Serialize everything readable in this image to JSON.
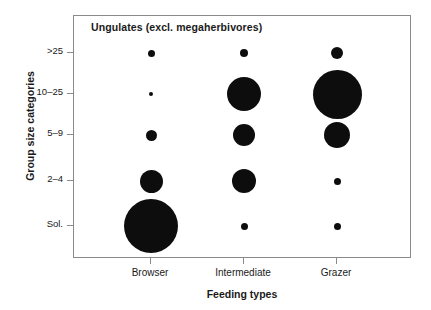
{
  "chart_data": {
    "type": "scatter",
    "title": "Ungulates (excl. megaherbivores)",
    "xlabel": "Feeding types",
    "ylabel": "Group size categories",
    "categories": [
      "Browser",
      "Intermediate",
      "Grazer"
    ],
    "y_categories": [
      "Sol.",
      "2–4",
      "5–9",
      "10–25",
      ">25"
    ],
    "grid": false,
    "legend": null,
    "bubble_color": "#0d0d0d",
    "points": [
      {
        "x": "Browser",
        "y": ">25",
        "size": 7
      },
      {
        "x": "Browser",
        "y": "10–25",
        "size": 4
      },
      {
        "x": "Browser",
        "y": "5–9",
        "size": 11
      },
      {
        "x": "Browser",
        "y": "2–4",
        "size": 23
      },
      {
        "x": "Browser",
        "y": "Sol.",
        "size": 54
      },
      {
        "x": "Intermediate",
        "y": ">25",
        "size": 8
      },
      {
        "x": "Intermediate",
        "y": "10–25",
        "size": 34
      },
      {
        "x": "Intermediate",
        "y": "5–9",
        "size": 22
      },
      {
        "x": "Intermediate",
        "y": "2–4",
        "size": 24
      },
      {
        "x": "Intermediate",
        "y": "Sol.",
        "size": 7
      },
      {
        "x": "Grazer",
        "y": ">25",
        "size": 12
      },
      {
        "x": "Grazer",
        "y": "10–25",
        "size": 49
      },
      {
        "x": "Grazer",
        "y": "5–9",
        "size": 26
      },
      {
        "x": "Grazer",
        "y": "2–4",
        "size": 7
      },
      {
        "x": "Grazer",
        "y": "Sol.",
        "size": 7
      }
    ]
  },
  "chart": {
    "title": "Ungulates (excl. megaherbivores)",
    "x_axis": {
      "label": "Feeding types",
      "ticks": [
        {
          "label": "Browser",
          "px": 150
        },
        {
          "label": "Intermediate",
          "px": 243
        },
        {
          "label": "Grazer",
          "px": 336
        }
      ]
    },
    "y_axis": {
      "label": "Group size categories",
      "ticks": [
        {
          "label": ">25",
          "px": 52
        },
        {
          "label": "10–25",
          "px": 93
        },
        {
          "label": "5–9",
          "px": 134
        },
        {
          "label": "2–4",
          "px": 180
        },
        {
          "label": "Sol.",
          "px": 225
        }
      ]
    },
    "bubbles": [
      {
        "name": "browser-gt25",
        "cx": 150,
        "cy": 52,
        "d": 7
      },
      {
        "name": "browser-10-25",
        "cx": 150,
        "cy": 93,
        "d": 4
      },
      {
        "name": "browser-5-9",
        "cx": 150,
        "cy": 134,
        "d": 11
      },
      {
        "name": "browser-2-4",
        "cx": 150,
        "cy": 180,
        "d": 23
      },
      {
        "name": "browser-sol",
        "cx": 150,
        "cy": 225,
        "d": 54
      },
      {
        "name": "intermediate-gt25",
        "cx": 243,
        "cy": 52,
        "d": 8
      },
      {
        "name": "intermediate-10-25",
        "cx": 243,
        "cy": 93,
        "d": 34
      },
      {
        "name": "intermediate-5-9",
        "cx": 243,
        "cy": 134,
        "d": 22
      },
      {
        "name": "intermediate-2-4",
        "cx": 243,
        "cy": 180,
        "d": 24
      },
      {
        "name": "intermediate-sol",
        "cx": 243,
        "cy": 225,
        "d": 7
      },
      {
        "name": "grazer-gt25",
        "cx": 336,
        "cy": 52,
        "d": 12
      },
      {
        "name": "grazer-10-25",
        "cx": 336,
        "cy": 93,
        "d": 49
      },
      {
        "name": "grazer-5-9",
        "cx": 336,
        "cy": 134,
        "d": 26
      },
      {
        "name": "grazer-2-4",
        "cx": 336,
        "cy": 180,
        "d": 7
      },
      {
        "name": "grazer-sol",
        "cx": 336,
        "cy": 225,
        "d": 7
      }
    ]
  }
}
